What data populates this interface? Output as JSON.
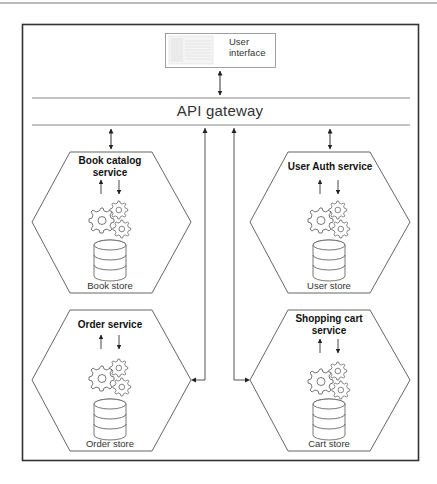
{
  "diagram": {
    "user_interface": {
      "label": "User interface",
      "line1": "User",
      "line2": "interface"
    },
    "gateway": {
      "label": "API gateway"
    },
    "services": [
      {
        "id": "book-catalog",
        "title_line1": "Book catalog",
        "title_line2": "service",
        "store": "Book store"
      },
      {
        "id": "user-auth",
        "title_line1": "User Auth service",
        "title_line2": "",
        "store": "User store"
      },
      {
        "id": "order",
        "title_line1": "Order service",
        "title_line2": "",
        "store": "Order store"
      },
      {
        "id": "shopping-cart",
        "title_line1": "Shopping cart",
        "title_line2": "service",
        "store": "Cart store"
      }
    ],
    "connections": [
      {
        "from": "User interface",
        "to": "API gateway",
        "type": "bidirectional"
      },
      {
        "from": "API gateway",
        "to": "Book catalog service",
        "type": "bidirectional"
      },
      {
        "from": "API gateway",
        "to": "User Auth service",
        "type": "bidirectional"
      },
      {
        "from": "API gateway",
        "to": "Order service",
        "type": "bidirectional"
      },
      {
        "from": "API gateway",
        "to": "Shopping cart service",
        "type": "bidirectional"
      }
    ],
    "colors": {
      "line": "#555555",
      "frame": "#333333",
      "background": "#ffffff"
    }
  }
}
